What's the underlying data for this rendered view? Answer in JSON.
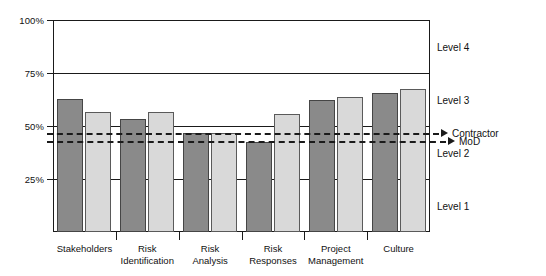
{
  "chart_data": {
    "type": "bar",
    "title": "",
    "xlabel": "",
    "ylabel": "",
    "ylim": [
      0,
      100
    ],
    "grid": true,
    "legend_position": "right-annotations",
    "categories": [
      "Stakeholders",
      "Risk Identification",
      "Risk Analysis",
      "Risk Responses",
      "Project Management",
      "Culture"
    ],
    "category_lines": [
      [
        "Stakeholders"
      ],
      [
        "Risk",
        "Identification"
      ],
      [
        "Risk",
        "Analysis"
      ],
      [
        "Risk",
        "Responses"
      ],
      [
        "Project",
        "Management"
      ],
      [
        "Culture"
      ]
    ],
    "series": [
      {
        "name": "dark-series",
        "color": "#8a8a8a",
        "values": [
          62.7,
          53.3,
          46.7,
          42.5,
          62.3,
          65.6
        ]
      },
      {
        "name": "light-series",
        "color": "#d9d9d9",
        "values": [
          56.6,
          56.6,
          46.7,
          55.7,
          63.7,
          67.5
        ]
      }
    ],
    "yticks": [
      {
        "value": 100,
        "label": "100%"
      },
      {
        "value": 75,
        "label": "75%"
      },
      {
        "value": 50,
        "label": "50%"
      },
      {
        "value": 25,
        "label": "25%"
      }
    ],
    "reference_lines": [
      {
        "label": "Contractor",
        "value": 46.7,
        "style": "dashed"
      },
      {
        "label": "MoD",
        "value": 43.0,
        "style": "dashed"
      }
    ],
    "band_labels": [
      {
        "label": "Level 4",
        "value": 87.5
      },
      {
        "label": "Level 3",
        "value": 62.5
      },
      {
        "label": "Level 2",
        "value": 37.5
      },
      {
        "label": "Level 1",
        "value": 12.5
      }
    ]
  }
}
